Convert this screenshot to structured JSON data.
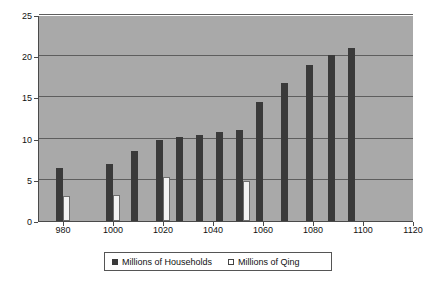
{
  "chart_data": {
    "type": "bar",
    "title": "",
    "xlabel": "",
    "ylabel": "",
    "xlim": [
      970,
      1120
    ],
    "ylim": [
      0,
      25
    ],
    "xticks": [
      980,
      1000,
      1020,
      1040,
      1060,
      1080,
      1100,
      1120
    ],
    "yticks": [
      0,
      5,
      10,
      15,
      20,
      25
    ],
    "grid": "horizontal",
    "legend_position": "bottom",
    "plot_background": "#a9a9a9",
    "page_background": "#ffffff",
    "series": [
      {
        "name": "Millions of Households",
        "color": "#3a3a3a",
        "x": [
          978,
          998,
          1008,
          1018,
          1026,
          1034,
          1042,
          1050,
          1058,
          1068,
          1078,
          1087,
          1095
        ],
        "values": [
          6.4,
          6.9,
          8.5,
          9.8,
          10.2,
          10.4,
          10.8,
          11.1,
          14.5,
          16.8,
          18.9,
          20.1,
          21.0
        ]
      },
      {
        "name": "Millions of Qing",
        "color": "#f2f2f2",
        "x": [
          981,
          1001,
          1021,
          1053
        ],
        "values": [
          3.0,
          3.2,
          5.3,
          4.8
        ]
      }
    ]
  },
  "legend": {
    "items": [
      {
        "label": "Millions of Households",
        "marker": "filled-square-marker"
      },
      {
        "label": "Millions of Qing",
        "marker": "hollow-square-marker"
      }
    ]
  },
  "axis": {
    "y_tick_labels": [
      "0",
      "5",
      "10",
      "15",
      "20",
      "25"
    ],
    "x_tick_labels": [
      "980",
      "1000",
      "1020",
      "1040",
      "1060",
      "1080",
      "1100",
      "1120"
    ]
  }
}
